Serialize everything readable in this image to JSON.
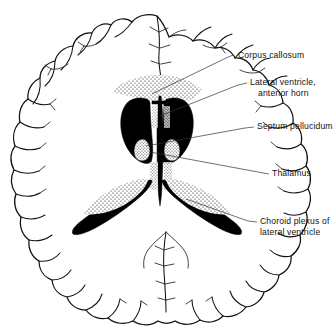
{
  "figure": {
    "view": "horizontal (axial) cross-section, superior view",
    "background_color": "#ffffff",
    "ink_color": "#111111",
    "fill_color": "#000000"
  },
  "labels": [
    {
      "id": "corpus-callosum",
      "lines": [
        "Corpus callosum"
      ],
      "text_x": 238,
      "text_y": 58,
      "leader": "M233,55 L224,59 L152,94",
      "target_structure": "corpus callosum (stippled band)"
    },
    {
      "id": "lateral-ventricle-anterior-horn",
      "lines": [
        "Lateral ventricle,",
        "anterior horn"
      ],
      "text_x": 250,
      "text_y": 85,
      "leader": "M247,83 L238,85 L160,116",
      "target_structure": "anterior horn of lateral ventricle"
    },
    {
      "id": "septum-pellucidum",
      "lines": [
        "Septum pellucidum"
      ],
      "text_x": 257,
      "text_y": 129,
      "leader": "M254,127 L245,128 L146,146",
      "target_structure": "septum pellucidum (midline)"
    },
    {
      "id": "thalamus",
      "lines": [
        "Thalamus"
      ],
      "text_x": 272,
      "text_y": 176,
      "leader": "M269,174 L258,172 L150,152",
      "target_structure": "thalamus"
    },
    {
      "id": "choroid-plexus",
      "lines": [
        "Choroid plexus of",
        "lateral ventricle"
      ],
      "text_x": 260,
      "text_y": 224,
      "leader": "M257,222 L248,221 L186,199",
      "target_structure": "choroid plexus of lateral ventricle"
    }
  ],
  "structures": [
    {
      "id": "cerebral-cortex",
      "name": "cerebral cortex with gyri and sulci"
    },
    {
      "id": "longitudinal-fissure",
      "name": "longitudinal fissure"
    },
    {
      "id": "corpus-callosum-band",
      "name": "corpus callosum, genu (stippled)"
    },
    {
      "id": "anterior-horn-left",
      "name": "left lateral ventricle anterior horn"
    },
    {
      "id": "anterior-horn-right",
      "name": "right lateral ventricle anterior horn"
    },
    {
      "id": "posterior-horn-left",
      "name": "left lateral ventricle posterior horn"
    },
    {
      "id": "posterior-horn-right",
      "name": "right lateral ventricle posterior horn"
    },
    {
      "id": "septum-pellucidum-shape",
      "name": "septum pellucidum"
    },
    {
      "id": "thalamus-left",
      "name": "left thalamus"
    },
    {
      "id": "thalamus-right",
      "name": "right thalamus"
    },
    {
      "id": "choroid-plexus-left",
      "name": "left choroid plexus (stippled)"
    },
    {
      "id": "choroid-plexus-right",
      "name": "right choroid plexus (stippled)"
    },
    {
      "id": "occipital-lobe-left",
      "name": "left occipital lobe"
    },
    {
      "id": "occipital-lobe-right",
      "name": "right occipital lobe"
    }
  ]
}
